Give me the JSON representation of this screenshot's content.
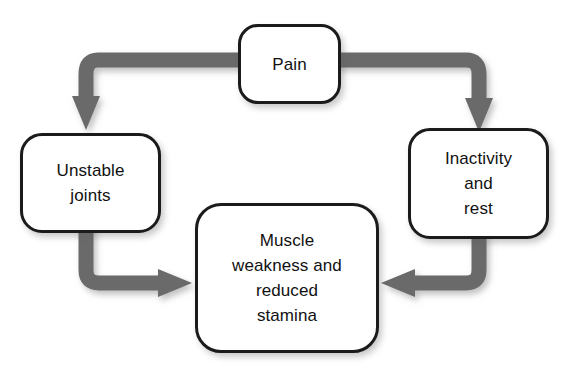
{
  "figure": {
    "background_color": "#ffffff",
    "arrow_color": "#6a6a6a",
    "box_border_color": "#1b1b1b",
    "box_fill_color": "#ffffff",
    "text_color": "#111111"
  },
  "nodes": [
    {
      "id": "pain",
      "label": "Pain"
    },
    {
      "id": "unstable",
      "label": "Unstable\njoints"
    },
    {
      "id": "inactive",
      "label": "Inactivity\nand\nrest"
    },
    {
      "id": "muscle",
      "label": "Muscle\nweakness and\nreduced\nstamina"
    }
  ],
  "edges": [
    {
      "id": "pain-to-unstable",
      "from": "pain",
      "to": "unstable",
      "label": ""
    },
    {
      "id": "pain-to-inactive",
      "from": "pain",
      "to": "inactive",
      "label": ""
    },
    {
      "id": "unstable-to-muscle",
      "from": "unstable",
      "to": "muscle",
      "label": ""
    },
    {
      "id": "inactive-to-muscle",
      "from": "inactive",
      "to": "muscle",
      "label": ""
    }
  ],
  "caption": {
    "text": ""
  }
}
